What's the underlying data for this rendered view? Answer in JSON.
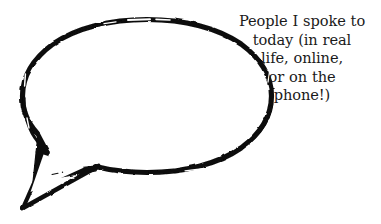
{
  "image": {
    "kind": "speech-bubble-illustration",
    "background_color": "#ffffff",
    "ink_color": "#0d0d0d",
    "text_color": "#1a1a1a"
  },
  "bubble": {
    "shape": "ellipse-with-pointed-tail",
    "tail_direction": "lower-left",
    "fill": "#ffffff",
    "stroke": "#0d0d0d",
    "style": "hand-drawn brush outline with rough broken edges",
    "contents": ""
  },
  "caption": {
    "alignment": "center",
    "full_text": "People I spoke to today (in real life, online, or on the phone!)",
    "lines": [
      "People I spoke to",
      "today (in real",
      "life, online,",
      "or on the",
      "phone!)"
    ]
  }
}
